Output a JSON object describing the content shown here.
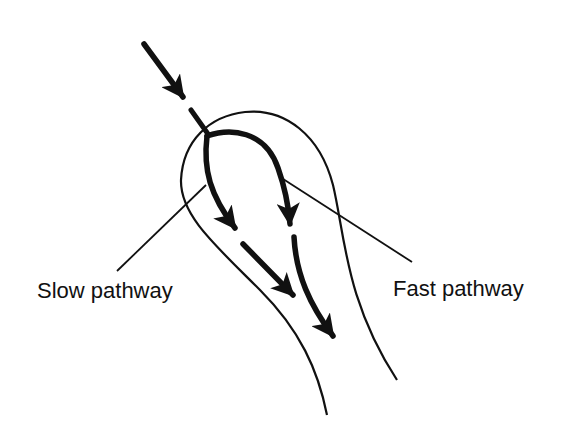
{
  "diagram": {
    "type": "anatomical-pathway-schematic",
    "labels": {
      "slow": "Slow pathway",
      "fast": "Fast pathway"
    },
    "colors": {
      "stroke": "#111111",
      "background": "#ffffff"
    }
  }
}
